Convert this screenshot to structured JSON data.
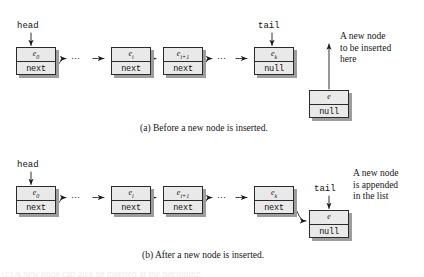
{
  "figure": {
    "kind": "linked-list-diagram",
    "colors": {
      "node_fill": "#e9e9e9",
      "node_border": "#2b2b2b",
      "node_shadow": "#9d9d9d",
      "ink": "#1a1a1a",
      "page": "#ffffff"
    }
  },
  "panel_a": {
    "caption": "(a) Before a new node is inserted.",
    "head_label": "head",
    "tail_label": "tail",
    "dots": "⋯",
    "annotation": "A new node to be inserted here",
    "annotation_lines": [
      "A new node",
      "to be inserted",
      "here"
    ],
    "nodes": [
      {
        "name": "node-e0",
        "element": "e",
        "subscript": "0",
        "pointer": "next"
      },
      {
        "name": "node-ei",
        "element": "e",
        "subscript": "i",
        "pointer": "next"
      },
      {
        "name": "node-ei1",
        "element": "e",
        "subscript": "i+1",
        "pointer": "next"
      },
      {
        "name": "node-ek",
        "element": "e",
        "subscript": "k",
        "pointer": "null"
      },
      {
        "name": "node-new",
        "element": "e",
        "subscript": "",
        "pointer": "null"
      }
    ]
  },
  "panel_b": {
    "caption": "(b) After a new node is inserted.",
    "head_label": "head",
    "tail_label": "tail",
    "dots": "⋯",
    "annotation": "A new node is appended in the list",
    "annotation_lines": [
      "A new node",
      "is appended",
      "in the list"
    ],
    "nodes": [
      {
        "name": "node-e0",
        "element": "e",
        "subscript": "0",
        "pointer": "next"
      },
      {
        "name": "node-ei",
        "element": "e",
        "subscript": "i",
        "pointer": "next"
      },
      {
        "name": "node-ei1",
        "element": "e",
        "subscript": "i+1",
        "pointer": "next"
      },
      {
        "name": "node-ek",
        "element": "e",
        "subscript": "k",
        "pointer": "next"
      },
      {
        "name": "node-new",
        "element": "e",
        "subscript": "",
        "pointer": "null"
      }
    ]
  },
  "cutoff_text": "(c) A new node can also be inserted at the beginning"
}
